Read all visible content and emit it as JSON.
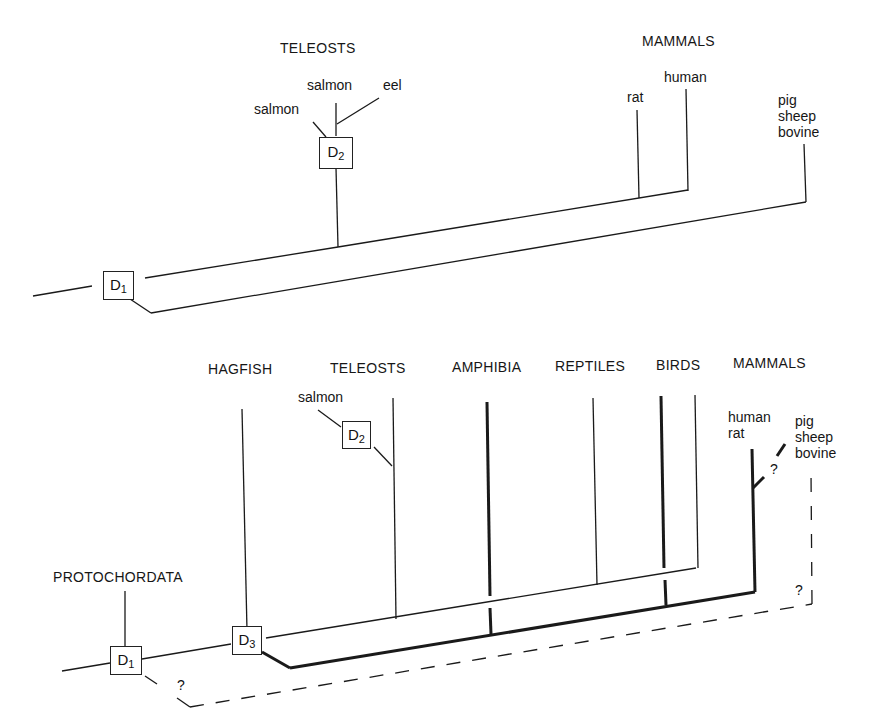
{
  "top_tree": {
    "groups": {
      "teleosts": "TELEOSTS",
      "mammals": "MAMMALS"
    },
    "species": {
      "salmon_a": "salmon",
      "salmon_b": "salmon",
      "eel": "eel",
      "rat": "rat",
      "human": "human",
      "pig": "pig",
      "sheep": "sheep",
      "bovine": "bovine"
    },
    "duplications": {
      "d1": "D",
      "d1_sub": "1",
      "d2": "D",
      "d2_sub": "2"
    }
  },
  "bottom_tree": {
    "groups": {
      "protochordata": "PROTOCHORDATA",
      "hagfish": "HAGFISH",
      "teleosts": "TELEOSTS",
      "amphibia": "AMPHIBIA",
      "reptiles": "REPTILES",
      "birds": "BIRDS",
      "mammals": "MAMMALS"
    },
    "species": {
      "salmon": "salmon",
      "human": "human",
      "rat": "rat",
      "pig": "pig",
      "sheep": "sheep",
      "bovine": "bovine"
    },
    "duplications": {
      "d1": "D",
      "d1_sub": "1",
      "d2": "D",
      "d2_sub": "2",
      "d3": "D",
      "d3_sub": "3"
    },
    "uncertain_marks": [
      "?",
      "?",
      "?"
    ]
  }
}
